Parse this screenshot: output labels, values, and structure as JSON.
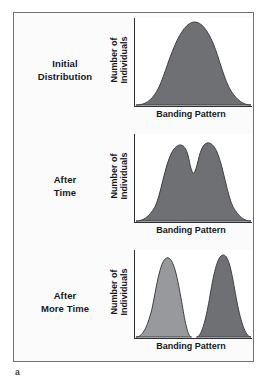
{
  "figure": {
    "part_label": "a",
    "frame_border_color": "#6f7277",
    "panel_background": "#fbfbfb",
    "plot_background": "#ffffff",
    "axis_color": "#2c2e31",
    "curve_fill_dark": "#6e7073",
    "curve_fill_light": "#97999c",
    "curve_stroke": "#3c3e41"
  },
  "panels": [
    {
      "stage_label": "Initial\nDistribution",
      "y_axis_label": "Number of\nIndividuals",
      "x_axis_label": "Banding Pattern"
    },
    {
      "stage_label": "After\nTime",
      "y_axis_label": "Number of\nIndividuals",
      "x_axis_label": "Banding Pattern"
    },
    {
      "stage_label": "After\nMore Time",
      "y_axis_label": "Number of\nIndividuals",
      "x_axis_label": "Banding Pattern"
    }
  ],
  "chart_data": [
    {
      "type": "area",
      "title": "Initial Distribution",
      "xlabel": "Banding Pattern",
      "ylabel": "Number of Individuals",
      "xlim": [
        0,
        100
      ],
      "ylim": [
        0,
        100
      ],
      "grid": false,
      "legend": "none",
      "annotations": [
        "Single broad unimodal normal distribution of banding pattern"
      ],
      "series": [
        {
          "name": "Initial population",
          "fill": "#6e7073",
          "modes": [
            {
              "center": 52,
              "height": 92,
              "width": 26
            }
          ],
          "x": [
            0,
            5,
            10,
            15,
            20,
            25,
            30,
            35,
            40,
            45,
            50,
            55,
            60,
            65,
            70,
            75,
            80,
            85,
            90,
            95,
            100
          ],
          "values": [
            1,
            2,
            4,
            7,
            13,
            23,
            37,
            54,
            71,
            85,
            92,
            91,
            85,
            74,
            59,
            43,
            28,
            16,
            8,
            3,
            1
          ]
        }
      ]
    },
    {
      "type": "area",
      "title": "After Time",
      "xlabel": "Banding Pattern",
      "ylabel": "Number of Individuals",
      "xlim": [
        0,
        100
      ],
      "ylim": [
        0,
        100
      ],
      "grid": false,
      "legend": "none",
      "annotations": [
        "Bimodal distribution emerging: two peaks with a shallow central dip"
      ],
      "series": [
        {
          "name": "Population after time",
          "fill": "#6e7073",
          "modes": [
            {
              "center": 38,
              "height": 90,
              "width": 17
            },
            {
              "center": 66,
              "height": 93,
              "width": 17
            }
          ],
          "x": [
            0,
            5,
            10,
            15,
            20,
            25,
            30,
            35,
            40,
            45,
            50,
            55,
            60,
            65,
            70,
            75,
            80,
            85,
            90,
            95,
            100
          ],
          "values": [
            1,
            2,
            4,
            9,
            20,
            40,
            66,
            85,
            90,
            78,
            62,
            72,
            88,
            93,
            86,
            66,
            42,
            22,
            10,
            4,
            1
          ]
        }
      ]
    },
    {
      "type": "area",
      "title": "After More Time",
      "xlabel": "Banding Pattern",
      "ylabel": "Number of Individuals",
      "xlim": [
        0,
        100
      ],
      "ylim": [
        0,
        100
      ],
      "grid": false,
      "legend": "none",
      "annotations": [
        "Two fully separated populations; left peak light gray, right peak dark gray"
      ],
      "series": [
        {
          "name": "Left population",
          "fill": "#97999c",
          "modes": [
            {
              "center": 30,
              "height": 94,
              "width": 13
            }
          ],
          "x": [
            0,
            5,
            10,
            15,
            20,
            25,
            30,
            35,
            40,
            45,
            50,
            55,
            60
          ],
          "values": [
            1,
            3,
            10,
            30,
            64,
            90,
            94,
            80,
            50,
            22,
            7,
            2,
            0
          ]
        },
        {
          "name": "Right population",
          "fill": "#6e7073",
          "modes": [
            {
              "center": 72,
              "height": 96,
              "width": 13
            }
          ],
          "x": [
            50,
            55,
            60,
            65,
            70,
            75,
            80,
            85,
            90,
            95,
            100
          ],
          "values": [
            0,
            2,
            8,
            32,
            72,
            95,
            92,
            64,
            30,
            10,
            2
          ]
        }
      ]
    }
  ]
}
